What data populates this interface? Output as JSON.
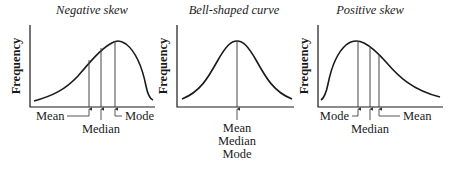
{
  "figure": {
    "panels": [
      {
        "id": "negative",
        "title": "Negative skew",
        "ylabel": "Frequency",
        "markers": [
          {
            "label": "Mean",
            "x": 89
          },
          {
            "label": "Median",
            "x": 101
          },
          {
            "label": "Mode",
            "x": 115
          }
        ]
      },
      {
        "id": "bell",
        "title": "Bell-shaped curve",
        "ylabel": "Frequency",
        "markers": [
          {
            "label": "Mean",
            "x": 237
          },
          {
            "label": "Median",
            "x": 237
          },
          {
            "label": "Mode",
            "x": 237
          }
        ]
      },
      {
        "id": "positive",
        "title": "Positive skew",
        "ylabel": "Frequency",
        "markers": [
          {
            "label": "Mode",
            "x": 358
          },
          {
            "label": "Median",
            "x": 370
          },
          {
            "label": "Mean",
            "x": 379
          }
        ]
      }
    ]
  }
}
